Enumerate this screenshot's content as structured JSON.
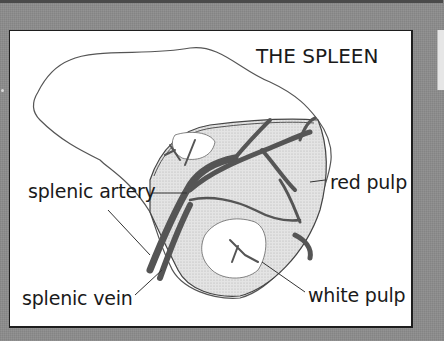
{
  "diagram": {
    "title": "THE SPLEEN",
    "labels": {
      "splenic_artery": "splenic artery",
      "splenic_vein": "splenic vein",
      "red_pulp": "red pulp",
      "white_pulp": "white pulp"
    },
    "colors": {
      "background": "#8c8c8c",
      "panel": "#ffffff",
      "border": "#1e1e1e",
      "vessel": "#5a5a5a",
      "red_pulp_fill": "#dcdcdc",
      "outline": "#3a3a3a"
    }
  }
}
